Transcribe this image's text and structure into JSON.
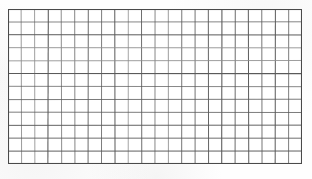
{
  "document": {
    "kind": "blank-grid-worksheet",
    "title": "Blank grid table",
    "background_color": "#fefefe",
    "paper_tint": "#f7f7f7"
  },
  "grid": {
    "columns": 22,
    "rows": 12,
    "x": 8,
    "y": 9,
    "width": 294,
    "height": 155,
    "cell_width": 13.36,
    "cell_height": 12.92,
    "line_color": "#5a5a5a",
    "line_color_light": "#8d8d8d",
    "border_color": "#4a4a4a",
    "line_width": 0.9,
    "border_width": 1.1,
    "cell_fill": "#ffffff",
    "cells_filled": 0,
    "total_cells": 264,
    "content": []
  },
  "chart_data": {
    "type": "table",
    "title": "",
    "columns": 22,
    "rows": 12,
    "column_headers": [],
    "row_headers": [],
    "values": []
  }
}
